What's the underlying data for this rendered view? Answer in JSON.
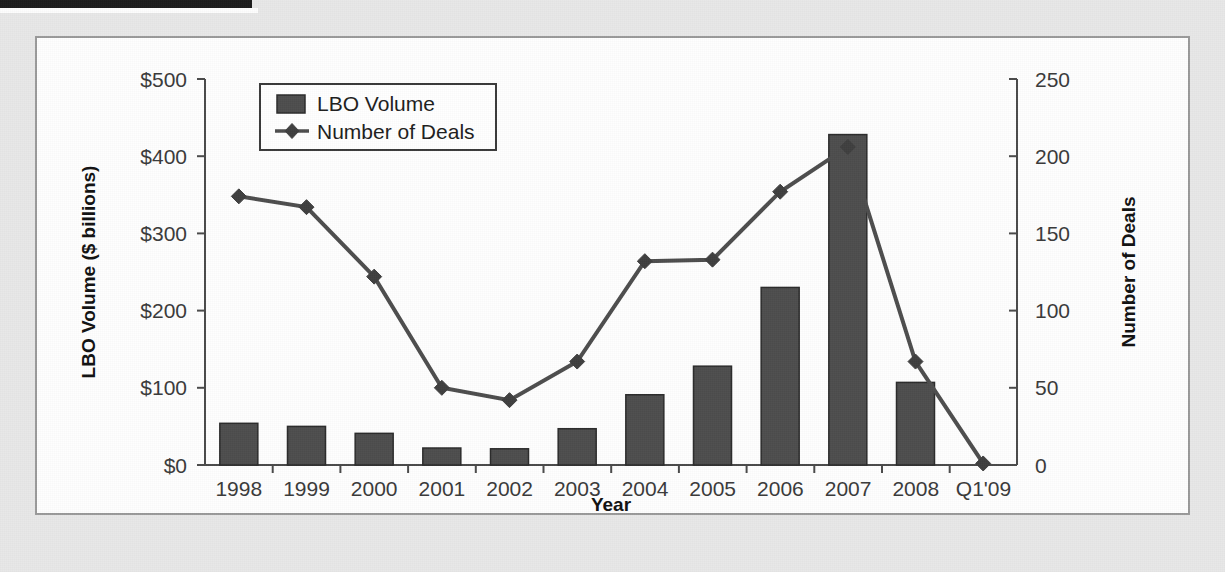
{
  "page": {
    "background_color": "#e8e8e8",
    "panel_color": "#fefefe",
    "panel_border_color": "#9a9a9a",
    "top_bar_color": "#1b1b1b"
  },
  "legend": {
    "items": [
      {
        "label": "LBO Volume",
        "marker": "square-swatch",
        "color": "#4d4d4d"
      },
      {
        "label": "Number of Deals",
        "marker": "line-diamond",
        "color": "#4d4d4d"
      }
    ]
  },
  "axes": {
    "left": {
      "title": "LBO Volume ($ billions)",
      "ticks": [
        "$0",
        "$100",
        "$200",
        "$300",
        "$400",
        "$500"
      ],
      "min": 0,
      "max": 500
    },
    "right": {
      "title": "Number of Deals",
      "ticks": [
        "0",
        "50",
        "100",
        "150",
        "200",
        "250"
      ],
      "min": 0,
      "max": 250
    },
    "bottom": {
      "title": "Year"
    }
  },
  "chart_data": {
    "type": "bar",
    "title": "",
    "subtitle": "",
    "xlabel": "Year",
    "ylabel": "LBO Volume ($ billions)",
    "y2label": "Number of Deals",
    "ylim": [
      0,
      500
    ],
    "y2lim": [
      0,
      250
    ],
    "grid": false,
    "legend_position": "top-left-inside",
    "categories": [
      "1998",
      "1999",
      "2000",
      "2001",
      "2002",
      "2003",
      "2004",
      "2005",
      "2006",
      "2007",
      "2008",
      "Q1'09"
    ],
    "series": [
      {
        "name": "LBO Volume",
        "type": "bar",
        "axis": "left",
        "unit": "$ billions",
        "color": "#4d4d4d",
        "values": [
          54,
          50,
          41,
          22,
          21,
          47,
          91,
          128,
          230,
          428,
          107,
          0
        ]
      },
      {
        "name": "Number of Deals",
        "type": "line",
        "axis": "right",
        "unit": "deals",
        "color": "#4d4d4d",
        "marker": "diamond",
        "values": [
          174,
          167,
          122,
          50,
          42,
          67,
          132,
          133,
          177,
          206,
          67,
          1
        ]
      }
    ]
  }
}
